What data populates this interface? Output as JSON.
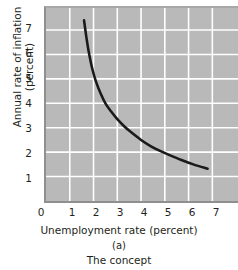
{
  "figure": {
    "panel_letter": "(a)",
    "caption": "The concept"
  },
  "chart_data": {
    "type": "line",
    "title": "",
    "subtitle": "",
    "xlabel": "Unemployment rate (percent)",
    "ylabel": "Annual rate of inflation (percent)",
    "ylabel_line1": "Annual rate of inflation",
    "ylabel_line2": "(percent)",
    "xlim": [
      0,
      8.08
    ],
    "ylim": [
      0,
      7.9
    ],
    "xticks": [
      0,
      1,
      2,
      3,
      4,
      5,
      6,
      7
    ],
    "yticks": [
      1,
      2,
      3,
      4,
      5,
      6,
      7
    ],
    "xticklabels": [
      "0",
      "1",
      "2",
      "3",
      "4",
      "5",
      "6",
      "7"
    ],
    "yticklabels": [
      "1",
      "2",
      "3",
      "4",
      "5",
      "6",
      "7"
    ],
    "grid": true,
    "grid_color": "#ffffff",
    "plot_bgcolor": "#b9b9b9",
    "legend": false,
    "legend_position": "none",
    "annotations": [],
    "series": [
      {
        "name": "Phillips curve",
        "color": "#1a1a1a",
        "linewidth": 2.6,
        "x": [
          1.6,
          1.7,
          1.8,
          1.95,
          2.1,
          2.3,
          2.5,
          2.75,
          3.0,
          3.3,
          3.6,
          4.0,
          4.4,
          4.8,
          5.2,
          5.7,
          6.2,
          6.8
        ],
        "y": [
          7.4,
          6.7,
          6.1,
          5.4,
          4.9,
          4.4,
          4.0,
          3.65,
          3.35,
          3.05,
          2.8,
          2.5,
          2.25,
          2.05,
          1.88,
          1.68,
          1.5,
          1.32
        ]
      }
    ]
  }
}
